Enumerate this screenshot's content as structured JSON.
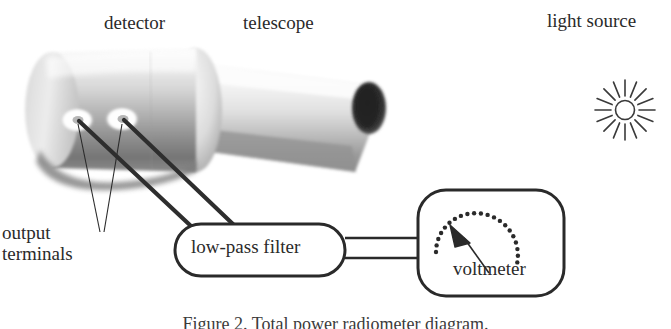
{
  "figure": {
    "caption": "Figure 2. Total power radiometer diagram.",
    "background_color": "#ffffff",
    "ink_color": "#1a1a1a"
  },
  "labels": {
    "detector": "detector",
    "telescope": "telescope",
    "light_source": "light source",
    "output_terminals_line1": "output",
    "output_terminals_line2": "terminals",
    "low_pass_filter": "low-pass filter",
    "voltmeter": "voltmeter"
  },
  "components": {
    "detector": {
      "name": "detector-cylinder",
      "shape": "shaded-cylinder",
      "terminals_count": 2
    },
    "telescope": {
      "name": "telescope-cone",
      "shape": "tapered-cone",
      "aperture": "dark-ellipse"
    },
    "light_source": {
      "name": "light-source-sun",
      "shape": "radiating-star",
      "rays": 16
    },
    "low_pass_filter": {
      "name": "low-pass-filter-box",
      "shape": "stadium"
    },
    "voltmeter": {
      "name": "voltmeter-box",
      "shape": "rounded-rect",
      "scale_dots": 29,
      "needle": "triangular-pointer"
    },
    "cables": {
      "signal_cables": 2,
      "leader_lines": 2,
      "filter_to_voltmeter_lines": 2
    }
  },
  "colors": {
    "ink": "#1a1a1a",
    "label_text": "#2a2a2a",
    "cylinder_light": "#f2f2f2",
    "cylinder_mid": "#b9b9b9",
    "cylinder_dark": "#6e6e6e",
    "aperture_dark": "#2b2b2b",
    "paper": "#ffffff"
  }
}
